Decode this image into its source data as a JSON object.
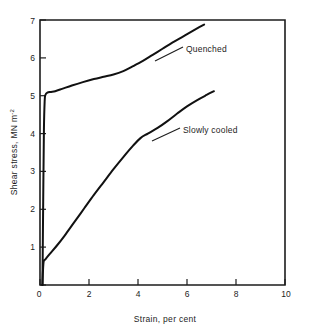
{
  "chart_data": {
    "type": "line",
    "title": "",
    "xlabel": "Strain, per cent",
    "ylabel": "Shear stress, MN m",
    "ylabel_sup": "-2",
    "xlim": [
      0,
      10
    ],
    "ylim": [
      0,
      7
    ],
    "xticks": [
      "0",
      "2",
      "4",
      "6",
      "8",
      "10"
    ],
    "xtick_values": [
      0,
      2,
      4,
      6,
      8,
      10
    ],
    "yticks": [
      "0",
      "1",
      "2",
      "3",
      "4",
      "5",
      "6",
      "7"
    ],
    "ytick_values": [
      0,
      1,
      2,
      3,
      4,
      5,
      6,
      7
    ],
    "grid": false,
    "legend_position": "inline-annotations",
    "series": [
      {
        "name": "Quenched",
        "label": "Quenched",
        "label_x": 4.6,
        "label_y": 6.25,
        "points": [
          [
            0.1,
            0.0
          ],
          [
            0.13,
            2.2
          ],
          [
            0.16,
            4.1
          ],
          [
            0.19,
            4.85
          ],
          [
            0.22,
            5.02
          ],
          [
            0.3,
            5.08
          ],
          [
            0.45,
            5.1
          ],
          [
            0.62,
            5.12
          ],
          [
            0.9,
            5.18
          ],
          [
            1.3,
            5.27
          ],
          [
            1.75,
            5.36
          ],
          [
            2.2,
            5.44
          ],
          [
            2.6,
            5.5
          ],
          [
            3.0,
            5.56
          ],
          [
            3.4,
            5.65
          ],
          [
            3.8,
            5.78
          ],
          [
            4.2,
            5.92
          ],
          [
            4.6,
            6.08
          ],
          [
            5.0,
            6.24
          ],
          [
            5.4,
            6.4
          ],
          [
            5.8,
            6.55
          ],
          [
            6.2,
            6.7
          ],
          [
            6.5,
            6.81
          ],
          [
            6.7,
            6.88
          ]
        ]
      },
      {
        "name": "Slowly cooled",
        "label": "Slowly cooled",
        "label_x": 4.6,
        "label_y": 4.18,
        "points": [
          [
            0.1,
            0.0
          ],
          [
            0.12,
            0.35
          ],
          [
            0.15,
            0.62
          ],
          [
            0.22,
            0.68
          ],
          [
            0.4,
            0.82
          ],
          [
            0.7,
            1.05
          ],
          [
            1.0,
            1.3
          ],
          [
            1.4,
            1.66
          ],
          [
            1.8,
            2.02
          ],
          [
            2.2,
            2.38
          ],
          [
            2.6,
            2.72
          ],
          [
            3.0,
            3.06
          ],
          [
            3.4,
            3.38
          ],
          [
            3.8,
            3.68
          ],
          [
            4.1,
            3.88
          ],
          [
            4.4,
            4.0
          ],
          [
            4.8,
            4.15
          ],
          [
            5.2,
            4.33
          ],
          [
            5.6,
            4.53
          ],
          [
            6.0,
            4.72
          ],
          [
            6.4,
            4.88
          ],
          [
            6.8,
            5.02
          ],
          [
            7.1,
            5.12
          ]
        ]
      }
    ]
  },
  "figure": {
    "alt": "Shear stress versus strain curves for quenched and slowly cooled material"
  }
}
